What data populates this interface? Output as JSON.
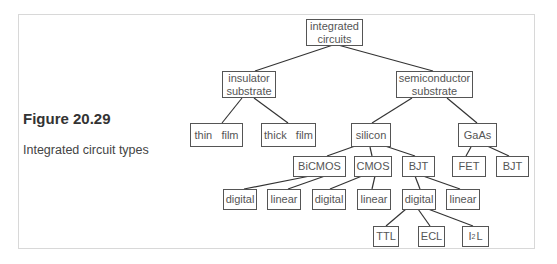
{
  "figure": {
    "title": "Figure 20.29",
    "caption": "Integrated circuit types"
  },
  "nodes": {
    "root": "integrated\ncircuits",
    "insulator": "insulator\nsubstrate",
    "semiconductor": "semiconductor\nsubstrate",
    "thin_film": "thin   film",
    "thick_film": "thick   film",
    "silicon": "silicon",
    "gaas": "GaAs",
    "bicmos": "BiCMOS",
    "cmos": "CMOS",
    "bjt_si": "BJT",
    "fet": "FET",
    "bjt_gaas": "BJT",
    "bicmos_digital": "digital",
    "bicmos_linear": "linear",
    "cmos_digital": "digital",
    "cmos_linear": "linear",
    "bjt_digital": "digital",
    "bjt_linear": "linear",
    "ttl": "TTL",
    "ecl": "ECL",
    "i2l_base": "I",
    "i2l_sup": "2",
    "i2l_tail": "L"
  }
}
